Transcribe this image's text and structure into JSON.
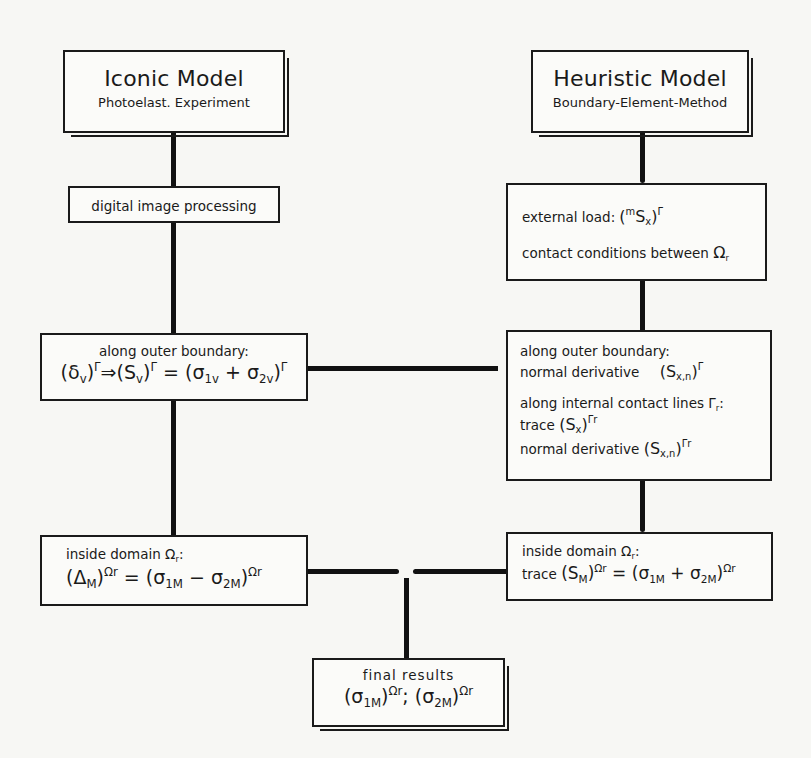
{
  "diagram": {
    "type": "flowchart",
    "left_column": {
      "header": {
        "title": "Iconic Model",
        "subtitle": "Photoelast. Experiment"
      },
      "step1": {
        "label": "digital image processing"
      },
      "step2": {
        "label": "along outer boundary:",
        "formula": {
          "p1": "(δ",
          "p1_sub": "v",
          "p1_close": ")",
          "p1_sup": "Γ",
          "arrow": "⇒",
          "p2": "(S",
          "p2_sub": "v",
          "p2_close": ")",
          "p2_sup": "Γ",
          "eq": " = (σ",
          "p3_sub": "1v",
          "plus": " + σ",
          "p4_sub": "2v",
          "p4_close": ")",
          "p4_sup": "Γ"
        }
      },
      "step3": {
        "label": "inside domain Ω",
        "label_sub": "r",
        "label_colon": ":",
        "formula": {
          "p1": "(Δ",
          "p1_sub": "M",
          "p1_close": ")",
          "p1_sup": "Ωr",
          "eq": " = (σ",
          "p2_sub": "1M",
          "minus": " − σ",
          "p3_sub": "2M",
          "p3_close": ")",
          "p3_sup": "Ωr"
        }
      }
    },
    "right_column": {
      "header": {
        "title": "Heuristic Model",
        "subtitle": "Boundary-Element-Method"
      },
      "step1": {
        "line1_label": "external load: ",
        "line1_formula": {
          "open": "(",
          "pre_sup": "m",
          "S": "S",
          "sub": "x",
          "close": ")",
          "sup": "Γ"
        },
        "line2_label": "contact conditions between ",
        "line2_symbol": "Ω",
        "line2_sub": "r"
      },
      "step2": {
        "line1": "along outer boundary:",
        "line2_label": "normal derivative",
        "line2_formula": {
          "open": "(S",
          "sub": "x,n",
          "close": ")",
          "sup": "Γ"
        },
        "line3": "along internal contact lines Γ",
        "line3_sub": "r",
        "line3_colon": ":",
        "line4_label": "trace ",
        "line4_formula": {
          "open": "(S",
          "sub": "x",
          "close": ")",
          "sup": "Γr"
        },
        "line5_label": "normal derivative ",
        "line5_formula": {
          "open": "(S",
          "sub": "x,n",
          "close": ")",
          "sup": "Γr"
        }
      },
      "step3": {
        "label": "inside domain Ω",
        "label_sub": "r",
        "label_colon": ":",
        "formula": {
          "prefix": "trace ",
          "p1": "(S",
          "p1_sub": "M",
          "p1_close": ")",
          "p1_sup": "Ωr",
          "eq": " = (σ",
          "p2_sub": "1M",
          "plus": " + σ",
          "p3_sub": "2M",
          "p3_close": ")",
          "p3_sup": "Ωr"
        }
      }
    },
    "final": {
      "label": "final results",
      "formula": {
        "p1": "(σ",
        "p1_sub": "1M",
        "p1_close": ")",
        "p1_sup": "Ωr",
        "sep": "; (σ",
        "p2_sub": "2M",
        "p2_close": ")",
        "p2_sup": "Ωr"
      }
    }
  }
}
